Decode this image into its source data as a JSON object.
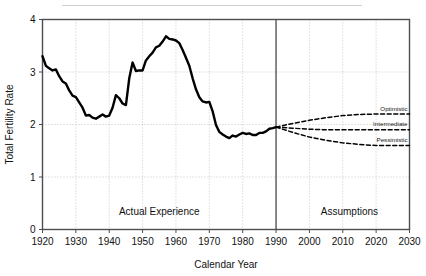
{
  "figure": {
    "background_color": "#ffffff",
    "axis_color": "#4d4d52",
    "grid_color": "#b9b9be",
    "line_color": "#000000"
  },
  "chart_data": {
    "type": "line",
    "title": "",
    "xlabel": "Calendar Year",
    "ylabel": "Total Fertility Rate",
    "xlim": [
      1920,
      2030
    ],
    "ylim": [
      0,
      4
    ],
    "xticks": [
      1920,
      1930,
      1940,
      1950,
      1960,
      1970,
      1980,
      1990,
      2000,
      2010,
      2020,
      2030
    ],
    "yticks": [
      0,
      1,
      2,
      3,
      4
    ],
    "grid": true,
    "legend_position": "inline-right",
    "annotations": [
      {
        "text": "Actual Experience",
        "x": 1955,
        "y": 0.28
      },
      {
        "text": "Assumptions",
        "x": 2012,
        "y": 0.28
      }
    ],
    "divider": {
      "x": 1990,
      "label": "historical-projection-divider"
    },
    "series": [
      {
        "name": "Actual Experience",
        "style": "solid",
        "label": "",
        "x": [
          1920,
          1921,
          1922,
          1923,
          1924,
          1925,
          1926,
          1927,
          1928,
          1929,
          1930,
          1931,
          1932,
          1933,
          1934,
          1935,
          1936,
          1937,
          1938,
          1939,
          1940,
          1941,
          1942,
          1943,
          1944,
          1945,
          1946,
          1947,
          1948,
          1949,
          1950,
          1951,
          1952,
          1953,
          1954,
          1955,
          1956,
          1957,
          1958,
          1959,
          1960,
          1961,
          1962,
          1963,
          1964,
          1965,
          1966,
          1967,
          1968,
          1969,
          1970,
          1971,
          1972,
          1973,
          1974,
          1975,
          1976,
          1977,
          1978,
          1979,
          1980,
          1981,
          1982,
          1983,
          1984,
          1985,
          1986,
          1987,
          1988,
          1989,
          1990
        ],
        "values": [
          3.3,
          3.12,
          3.07,
          3.03,
          3.05,
          2.92,
          2.82,
          2.78,
          2.65,
          2.55,
          2.52,
          2.42,
          2.32,
          2.17,
          2.18,
          2.13,
          2.11,
          2.15,
          2.19,
          2.15,
          2.17,
          2.32,
          2.56,
          2.5,
          2.4,
          2.37,
          2.88,
          3.18,
          3.02,
          3.03,
          3.03,
          3.22,
          3.3,
          3.37,
          3.47,
          3.5,
          3.58,
          3.68,
          3.63,
          3.62,
          3.6,
          3.55,
          3.42,
          3.27,
          3.12,
          2.88,
          2.67,
          2.52,
          2.44,
          2.42,
          2.43,
          2.25,
          1.99,
          1.86,
          1.81,
          1.77,
          1.74,
          1.79,
          1.77,
          1.81,
          1.84,
          1.82,
          1.83,
          1.8,
          1.8,
          1.84,
          1.84,
          1.87,
          1.92,
          1.93,
          1.95
        ]
      },
      {
        "name": "Optimistic",
        "style": "dashed",
        "label": "Optimistic",
        "x": [
          1990,
          1995,
          2000,
          2005,
          2010,
          2015,
          2020,
          2025,
          2030
        ],
        "values": [
          1.95,
          2.02,
          2.08,
          2.13,
          2.17,
          2.19,
          2.2,
          2.2,
          2.2
        ]
      },
      {
        "name": "Intermediate",
        "style": "dashed",
        "label": "Intermediate",
        "x": [
          1990,
          1995,
          2000,
          2005,
          2010,
          2015,
          2020,
          2025,
          2030
        ],
        "values": [
          1.95,
          1.93,
          1.91,
          1.9,
          1.9,
          1.9,
          1.9,
          1.9,
          1.9
        ]
      },
      {
        "name": "Pessimistic",
        "style": "dashed",
        "label": "Pessimistic",
        "x": [
          1990,
          1995,
          2000,
          2005,
          2010,
          2015,
          2020,
          2025,
          2030
        ],
        "values": [
          1.95,
          1.85,
          1.76,
          1.7,
          1.65,
          1.62,
          1.6,
          1.6,
          1.6
        ]
      }
    ]
  }
}
